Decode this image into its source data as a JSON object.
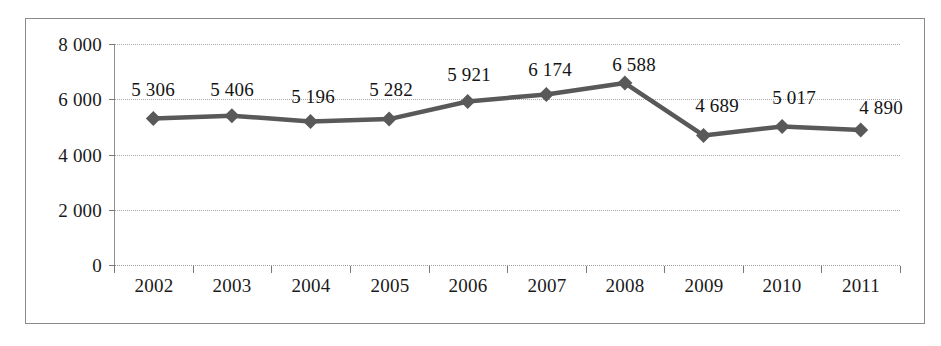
{
  "chart_data": {
    "type": "line",
    "title": "",
    "subtitle": "",
    "xlabel": "",
    "ylabel": "",
    "categories": [
      "2002",
      "2003",
      "2004",
      "2005",
      "2006",
      "2007",
      "2008",
      "2009",
      "2010",
      "2011"
    ],
    "values": [
      5306,
      5406,
      5196,
      5282,
      5921,
      6174,
      6588,
      4689,
      5017,
      4890
    ],
    "point_labels": [
      "5 306",
      "5 406",
      "5 196",
      "5 282",
      "5 921",
      "6 174",
      "6 588",
      "4 689",
      "5 017",
      "4 890"
    ],
    "ylim": [
      0,
      8000
    ],
    "y_ticks": [
      8000,
      6000,
      4000,
      2000,
      0
    ],
    "y_tick_labels": [
      "8 000",
      "6 000",
      "4 000",
      "2 000",
      "0"
    ],
    "grid": true,
    "legend": null,
    "legend_position": "none",
    "series_color": "#595959",
    "marker": "diamond",
    "gridline_color": "#a8a8a8",
    "frame_color": "#8b8b8b",
    "background_color": "#ffffff",
    "text_color": "#1a1a1a"
  }
}
